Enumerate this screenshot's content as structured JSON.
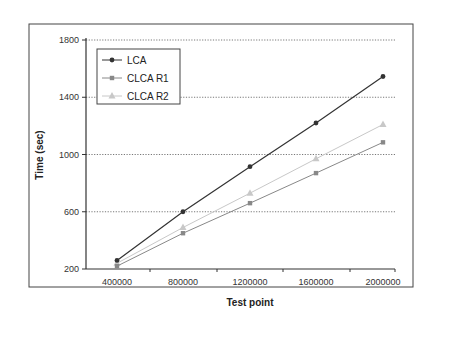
{
  "chart_data": {
    "type": "line",
    "title": "",
    "xlabel": "Test point",
    "ylabel": "Time (sec)",
    "x": [
      400000,
      800000,
      1200000,
      1600000,
      2000000
    ],
    "x_tick_labels": [
      "400000",
      "800000",
      "1200000",
      "1600000",
      "2000000"
    ],
    "y_tick_labels": [
      "200",
      "600",
      "1000",
      "1400",
      "1800"
    ],
    "y_ticks": [
      200,
      600,
      1000,
      1400,
      1800
    ],
    "ylim": [
      200,
      1800
    ],
    "grid": "horizontal dotted",
    "legend_position": "upper-left inside",
    "series": [
      {
        "name": "LCA",
        "marker": "diamond",
        "color": "#333333",
        "values": [
          260,
          600,
          915,
          1220,
          1545
        ]
      },
      {
        "name": "CLCA R1",
        "marker": "square",
        "color": "#888888",
        "values": [
          220,
          450,
          660,
          870,
          1085
        ]
      },
      {
        "name": "CLCA R2",
        "marker": "triangle",
        "color": "#c8c8c8",
        "values": [
          240,
          490,
          730,
          970,
          1210
        ]
      }
    ]
  }
}
